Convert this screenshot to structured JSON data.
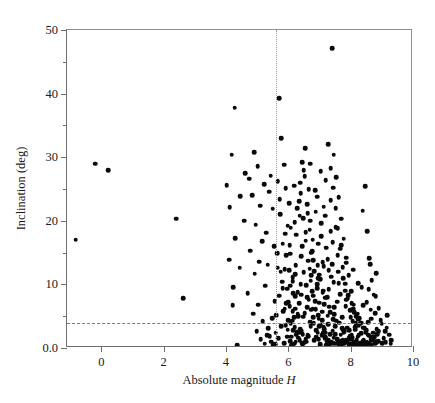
{
  "chart_data": {
    "type": "scatter",
    "title": "",
    "xlabel": "Absolute magnitude H",
    "ylabel": "Inclination (deg)",
    "xlim": [
      -1.1,
      10
    ],
    "ylim": [
      0,
      50
    ],
    "xticks": [
      0,
      2,
      4,
      6,
      8,
      10
    ],
    "xticklabels": [
      "0",
      "2",
      "4",
      "6",
      "8",
      "10"
    ],
    "yticks": [
      0,
      10,
      20,
      30,
      40,
      50
    ],
    "yticklabels": [
      "0.0",
      "10",
      "20",
      "30",
      "40",
      "50"
    ],
    "yminorticks": [
      5,
      15,
      25,
      35,
      45
    ],
    "grid": false,
    "legend": null,
    "marker": {
      "shape": "circle",
      "color": "#0a0a0a",
      "size": 4.6
    },
    "annotations": [
      {
        "kind": "hline",
        "value": 4.0,
        "style": "dashed",
        "color": "#7b7b7b"
      },
      {
        "kind": "vline",
        "value": 5.6,
        "style": "dotted",
        "color": "#9a9a9a"
      }
    ],
    "points": [
      [
        -0.82,
        17.0
      ],
      [
        -0.2,
        29.0
      ],
      [
        0.22,
        28.0
      ],
      [
        2.4,
        20.3
      ],
      [
        2.62,
        7.8
      ],
      [
        4.28,
        37.8
      ],
      [
        4.18,
        30.4
      ],
      [
        4.02,
        25.6
      ],
      [
        4.46,
        23.9
      ],
      [
        4.12,
        22.1
      ],
      [
        4.58,
        20.0
      ],
      [
        4.3,
        17.3
      ],
      [
        4.1,
        13.9
      ],
      [
        4.44,
        12.6
      ],
      [
        4.24,
        9.6
      ],
      [
        4.22,
        6.7
      ],
      [
        4.36,
        0.4
      ],
      [
        4.62,
        27.5
      ],
      [
        4.74,
        26.6
      ],
      [
        4.9,
        30.8
      ],
      [
        4.84,
        24.0
      ],
      [
        5.02,
        28.6
      ],
      [
        5.1,
        22.4
      ],
      [
        4.96,
        19.4
      ],
      [
        5.22,
        25.8
      ],
      [
        5.16,
        16.8
      ],
      [
        4.78,
        15.3
      ],
      [
        5.06,
        13.6
      ],
      [
        4.92,
        11.7
      ],
      [
        5.3,
        18.1
      ],
      [
        5.26,
        9.8
      ],
      [
        5.44,
        27.1
      ],
      [
        5.38,
        24.6
      ],
      [
        5.5,
        21.9
      ],
      [
        5.34,
        13.1
      ],
      [
        5.56,
        7.4
      ],
      [
        5.48,
        4.7
      ],
      [
        5.36,
        3.1
      ],
      [
        5.6,
        2.4
      ],
      [
        5.7,
        39.3
      ],
      [
        5.78,
        33.0
      ],
      [
        5.86,
        28.8
      ],
      [
        5.66,
        26.2
      ],
      [
        5.92,
        25.1
      ],
      [
        5.74,
        21.0
      ],
      [
        5.98,
        19.2
      ],
      [
        5.82,
        16.4
      ],
      [
        6.06,
        14.8
      ],
      [
        5.88,
        12.4
      ],
      [
        6.14,
        11.1
      ],
      [
        5.96,
        9.3
      ],
      [
        6.22,
        8.1
      ],
      [
        6.04,
        6.6
      ],
      [
        6.3,
        5.4
      ],
      [
        6.12,
        4.3
      ],
      [
        6.2,
        3.3
      ],
      [
        6.28,
        2.5
      ],
      [
        6.1,
        1.8
      ],
      [
        6.36,
        1.2
      ],
      [
        6.18,
        0.7
      ],
      [
        6.44,
        29.2
      ],
      [
        6.52,
        27.0
      ],
      [
        6.4,
        24.3
      ],
      [
        6.6,
        22.6
      ],
      [
        6.48,
        20.4
      ],
      [
        6.68,
        18.6
      ],
      [
        6.56,
        16.9
      ],
      [
        6.76,
        15.2
      ],
      [
        6.64,
        13.7
      ],
      [
        6.84,
        12.1
      ],
      [
        6.72,
        10.6
      ],
      [
        6.92,
        9.4
      ],
      [
        6.8,
        8.2
      ],
      [
        7.0,
        7.1
      ],
      [
        6.88,
        6.1
      ],
      [
        6.96,
        5.2
      ],
      [
        7.08,
        4.4
      ],
      [
        7.04,
        3.6
      ],
      [
        7.16,
        3.0
      ],
      [
        7.12,
        2.3
      ],
      [
        7.2,
        1.7
      ],
      [
        7.24,
        1.1
      ],
      [
        7.32,
        0.6
      ],
      [
        7.4,
        47.1
      ],
      [
        7.28,
        32.0
      ],
      [
        7.46,
        30.4
      ],
      [
        7.36,
        28.3
      ],
      [
        7.54,
        26.9
      ],
      [
        7.44,
        25.2
      ],
      [
        7.62,
        23.7
      ],
      [
        7.52,
        22.0
      ],
      [
        7.7,
        20.3
      ],
      [
        7.58,
        18.8
      ],
      [
        7.78,
        17.2
      ],
      [
        7.66,
        15.6
      ],
      [
        7.86,
        14.2
      ],
      [
        7.74,
        12.7
      ],
      [
        7.94,
        11.4
      ],
      [
        7.82,
        10.1
      ],
      [
        8.02,
        8.9
      ],
      [
        7.9,
        7.8
      ],
      [
        8.1,
        6.8
      ],
      [
        7.98,
        5.9
      ],
      [
        8.18,
        5.0
      ],
      [
        8.06,
        4.2
      ],
      [
        8.26,
        3.5
      ],
      [
        8.14,
        2.9
      ],
      [
        8.34,
        2.3
      ],
      [
        8.22,
        1.8
      ],
      [
        8.42,
        1.3
      ],
      [
        8.3,
        0.8
      ],
      [
        8.5,
        0.4
      ],
      [
        8.58,
        2.0
      ],
      [
        8.66,
        4.6
      ],
      [
        8.74,
        8.4
      ],
      [
        8.82,
        11.8
      ],
      [
        8.6,
        14.1
      ],
      [
        8.9,
        6.3
      ],
      [
        8.68,
        1.6
      ],
      [
        9.0,
        3.8
      ],
      [
        9.12,
        0.9
      ],
      [
        9.24,
        2.1
      ],
      [
        8.46,
        25.4
      ],
      [
        8.38,
        21.6
      ],
      [
        8.54,
        18.4
      ],
      [
        8.62,
        13.2
      ],
      [
        8.78,
        5.5
      ],
      [
        6.34,
        23.1
      ],
      [
        6.5,
        11.9
      ],
      [
        6.66,
        7.6
      ],
      [
        6.82,
        3.9
      ],
      [
        6.98,
        1.4
      ],
      [
        7.14,
        12.9
      ],
      [
        7.3,
        9.2
      ],
      [
        7.48,
        6.4
      ],
      [
        7.64,
        4.0
      ],
      [
        7.8,
        2.6
      ],
      [
        7.96,
        1.5
      ],
      [
        8.12,
        0.9
      ],
      [
        6.26,
        17.8
      ],
      [
        6.42,
        14.4
      ],
      [
        6.58,
        9.9
      ],
      [
        6.74,
        6.0
      ],
      [
        6.9,
        2.8
      ],
      [
        7.06,
        19.6
      ],
      [
        7.22,
        15.8
      ],
      [
        7.38,
        11.2
      ],
      [
        7.56,
        7.3
      ],
      [
        7.72,
        4.8
      ],
      [
        7.88,
        3.2
      ],
      [
        8.04,
        2.0
      ],
      [
        8.2,
        1.2
      ],
      [
        5.64,
        14.9
      ],
      [
        5.8,
        10.4
      ],
      [
        5.94,
        7.0
      ],
      [
        6.08,
        3.8
      ],
      [
        6.24,
        1.0
      ],
      [
        5.72,
        23.4
      ],
      [
        5.9,
        18.0
      ],
      [
        6.02,
        12.2
      ],
      [
        6.16,
        8.6
      ],
      [
        6.32,
        5.0
      ],
      [
        6.46,
        2.2
      ],
      [
        7.02,
        10.8
      ],
      [
        7.18,
        7.9
      ],
      [
        7.34,
        5.6
      ],
      [
        7.5,
        3.4
      ],
      [
        7.68,
        2.1
      ],
      [
        7.84,
        1.3
      ],
      [
        8.0,
        0.7
      ],
      [
        6.62,
        21.2
      ],
      [
        6.78,
        17.0
      ],
      [
        6.94,
        13.0
      ],
      [
        7.1,
        8.7
      ],
      [
        7.26,
        5.1
      ],
      [
        7.42,
        2.7
      ],
      [
        7.58,
        1.0
      ],
      [
        8.36,
        9.6
      ],
      [
        8.52,
        7.2
      ],
      [
        8.68,
        10.7
      ],
      [
        8.84,
        3.0
      ],
      [
        9.06,
        1.5
      ],
      [
        9.18,
        5.2
      ],
      [
        9.3,
        1.2
      ],
      [
        6.38,
        26.0
      ],
      [
        6.54,
        31.4
      ],
      [
        6.7,
        29.0
      ],
      [
        6.86,
        24.8
      ],
      [
        7.04,
        27.8
      ],
      [
        7.2,
        26.4
      ],
      [
        7.36,
        23.2
      ],
      [
        7.52,
        19.0
      ],
      [
        7.7,
        16.2
      ],
      [
        7.86,
        13.4
      ],
      [
        8.08,
        12.3
      ],
      [
        8.24,
        10.2
      ],
      [
        8.4,
        6.7
      ],
      [
        8.56,
        4.1
      ],
      [
        8.72,
        2.4
      ],
      [
        8.88,
        1.1
      ],
      [
        6.2,
        19.8
      ],
      [
        6.44,
        16.0
      ],
      [
        6.68,
        12.5
      ],
      [
        6.92,
        10.0
      ],
      [
        7.16,
        6.9
      ],
      [
        7.44,
        4.5
      ],
      [
        7.76,
        2.9
      ],
      [
        8.06,
        1.6
      ],
      [
        5.84,
        5.8
      ],
      [
        5.98,
        2.9
      ],
      [
        6.12,
        0.5
      ],
      [
        6.3,
        8.8
      ],
      [
        6.48,
        4.9
      ],
      [
        6.64,
        1.9
      ],
      [
        6.8,
        13.8
      ],
      [
        7.0,
        11.5
      ],
      [
        7.24,
        8.0
      ],
      [
        7.48,
        5.3
      ],
      [
        7.72,
        3.1
      ],
      [
        7.98,
        1.9
      ],
      [
        8.28,
        4.7
      ],
      [
        8.44,
        3.2
      ],
      [
        8.64,
        6.0
      ],
      [
        8.8,
        8.1
      ],
      [
        8.96,
        4.4
      ],
      [
        6.02,
        22.8
      ],
      [
        6.18,
        25.5
      ],
      [
        6.36,
        20.8
      ],
      [
        6.56,
        18.2
      ],
      [
        6.74,
        15.0
      ],
      [
        6.96,
        11.0
      ],
      [
        7.12,
        9.0
      ],
      [
        7.32,
        6.5
      ],
      [
        7.54,
        4.3
      ],
      [
        7.78,
        2.5
      ],
      [
        8.02,
        1.4
      ],
      [
        8.32,
        0.6
      ],
      [
        5.92,
        3.6
      ],
      [
        6.06,
        1.1
      ],
      [
        6.22,
        6.2
      ],
      [
        6.42,
        2.7
      ],
      [
        6.58,
        1.0
      ],
      [
        6.86,
        7.4
      ],
      [
        7.08,
        5.7
      ],
      [
        7.28,
        3.7
      ],
      [
        7.5,
        2.2
      ],
      [
        7.74,
        1.2
      ],
      [
        8.16,
        3.9
      ],
      [
        8.48,
        2.6
      ],
      [
        8.76,
        1.7
      ],
      [
        5.68,
        1.5
      ],
      [
        5.86,
        0.8
      ],
      [
        6.1,
        0.3
      ],
      [
        6.26,
        2.1
      ],
      [
        6.46,
        0.6
      ],
      [
        6.7,
        4.1
      ],
      [
        6.94,
        2.4
      ],
      [
        7.18,
        1.5
      ],
      [
        7.38,
        0.9
      ],
      [
        7.62,
        0.5
      ],
      [
        7.9,
        0.9
      ],
      [
        8.18,
        0.4
      ],
      [
        8.42,
        0.9
      ],
      [
        6.14,
        10.5
      ],
      [
        6.34,
        7.0
      ],
      [
        6.52,
        5.5
      ],
      [
        6.72,
        3.4
      ],
      [
        6.9,
        1.7
      ],
      [
        7.1,
        13.5
      ],
      [
        7.3,
        12.2
      ],
      [
        7.46,
        10.3
      ],
      [
        7.66,
        8.5
      ],
      [
        7.84,
        6.6
      ],
      [
        8.0,
        4.8
      ],
      [
        8.14,
        3.3
      ],
      [
        8.26,
        2.0
      ],
      [
        8.38,
        1.1
      ],
      [
        8.54,
        0.6
      ],
      [
        8.7,
        1.3
      ],
      [
        8.86,
        2.2
      ],
      [
        9.1,
        2.6
      ],
      [
        6.04,
        16.2
      ],
      [
        6.24,
        13.0
      ],
      [
        6.4,
        10.0
      ],
      [
        6.6,
        8.0
      ],
      [
        6.78,
        6.2
      ],
      [
        6.98,
        4.6
      ],
      [
        7.14,
        3.3
      ],
      [
        7.34,
        2.2
      ],
      [
        7.56,
        1.4
      ],
      [
        7.8,
        0.8
      ],
      [
        8.1,
        0.5
      ],
      [
        5.76,
        12.0
      ],
      [
        5.94,
        14.6
      ],
      [
        6.08,
        18.9
      ],
      [
        6.28,
        22.0
      ],
      [
        6.5,
        28.0
      ],
      [
        6.66,
        25.0
      ],
      [
        6.88,
        21.4
      ],
      [
        7.06,
        17.6
      ],
      [
        7.26,
        14.0
      ],
      [
        7.42,
        16.6
      ],
      [
        7.6,
        12.0
      ],
      [
        7.82,
        9.0
      ],
      [
        8.04,
        7.0
      ],
      [
        8.22,
        5.4
      ],
      [
        8.34,
        4.0
      ],
      [
        8.5,
        2.8
      ],
      [
        8.66,
        1.8
      ],
      [
        8.82,
        0.9
      ],
      [
        5.7,
        8.2
      ],
      [
        5.88,
        6.2
      ],
      [
        6.0,
        4.4
      ],
      [
        6.16,
        2.8
      ],
      [
        6.32,
        1.6
      ],
      [
        6.44,
        0.8
      ],
      [
        6.62,
        2.0
      ],
      [
        6.84,
        1.2
      ],
      [
        7.02,
        0.6
      ],
      [
        7.22,
        0.4
      ],
      [
        7.44,
        0.8
      ],
      [
        7.68,
        1.1
      ],
      [
        7.94,
        0.6
      ],
      [
        8.2,
        0.3
      ],
      [
        8.46,
        0.5
      ],
      [
        4.98,
        2.6
      ],
      [
        5.12,
        1.4
      ],
      [
        5.24,
        0.7
      ],
      [
        5.4,
        1.9
      ],
      [
        5.52,
        0.5
      ],
      [
        5.62,
        5.2
      ],
      [
        5.78,
        3.4
      ],
      [
        5.96,
        1.8
      ],
      [
        6.14,
        5.8
      ],
      [
        6.38,
        3.0
      ],
      [
        6.56,
        1.4
      ],
      [
        6.76,
        8.9
      ],
      [
        7.96,
        2.8
      ],
      [
        8.58,
        9.2
      ],
      [
        8.9,
        2.6
      ],
      [
        9.02,
        0.8
      ],
      [
        6.7,
        20.0
      ],
      [
        6.92,
        23.8
      ],
      [
        7.14,
        22.2
      ],
      [
        7.36,
        18.4
      ],
      [
        7.58,
        14.6
      ],
      [
        7.76,
        11.0
      ],
      [
        7.92,
        8.3
      ],
      [
        8.08,
        6.2
      ],
      [
        8.24,
        4.5
      ],
      [
        8.4,
        3.2
      ],
      [
        8.56,
        2.1
      ],
      [
        8.72,
        1.2
      ],
      [
        9.16,
        3.2
      ],
      [
        9.28,
        0.7
      ],
      [
        5.54,
        16.0
      ],
      [
        5.66,
        12.6
      ],
      [
        5.82,
        9.4
      ],
      [
        6.0,
        7.2
      ],
      [
        6.18,
        4.8
      ],
      [
        6.36,
        2.4
      ],
      [
        6.52,
        0.9
      ],
      [
        6.74,
        11.4
      ],
      [
        6.96,
        16.4
      ],
      [
        7.18,
        20.8
      ],
      [
        7.4,
        13.2
      ],
      [
        7.62,
        10.2
      ],
      [
        7.86,
        7.6
      ],
      [
        8.12,
        5.6
      ],
      [
        8.3,
        3.8
      ],
      [
        8.48,
        2.4
      ],
      [
        8.64,
        1.4
      ],
      [
        8.78,
        0.7
      ],
      [
        4.7,
        8.6
      ],
      [
        4.88,
        5.4
      ],
      [
        5.04,
        6.8
      ],
      [
        5.18,
        4.2
      ],
      [
        5.32,
        2.0
      ],
      [
        5.46,
        1.0
      ],
      [
        5.58,
        0.6
      ],
      [
        7.08,
        2.0
      ],
      [
        7.28,
        1.2
      ],
      [
        7.52,
        0.7
      ],
      [
        7.7,
        0.4
      ],
      [
        8.02,
        0.4
      ],
      [
        8.28,
        0.7
      ],
      [
        8.52,
        1.0
      ],
      [
        8.68,
        0.5
      ],
      [
        6.06,
        9.8
      ],
      [
        6.22,
        11.6
      ],
      [
        6.42,
        8.4
      ],
      [
        6.6,
        6.4
      ],
      [
        6.8,
        4.8
      ],
      [
        7.0,
        3.4
      ],
      [
        7.2,
        2.4
      ],
      [
        7.46,
        1.6
      ],
      [
        7.74,
        0.9
      ],
      [
        8.06,
        0.6
      ],
      [
        8.36,
        0.4
      ],
      [
        8.6,
        0.8
      ]
    ]
  }
}
